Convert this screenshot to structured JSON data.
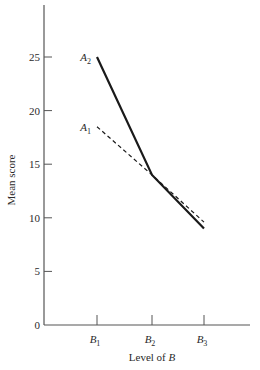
{
  "chart_data": {
    "type": "line",
    "title": "",
    "xlabel": "Level of B",
    "xlabel_prefix": "Level of ",
    "xlabel_var": "B",
    "ylabel": "Mean score",
    "categories": [
      "B1",
      "B2",
      "B3"
    ],
    "category_labels": [
      {
        "base": "B",
        "sub": "1"
      },
      {
        "base": "B",
        "sub": "2"
      },
      {
        "base": "B",
        "sub": "3"
      }
    ],
    "series": [
      {
        "name": "A2",
        "label_base": "A",
        "label_sub": "2",
        "style": "solid",
        "values": [
          25,
          14,
          9
        ]
      },
      {
        "name": "A1",
        "label_base": "A",
        "label_sub": "1",
        "style": "dashed",
        "values": [
          18.5,
          14,
          9.6
        ]
      }
    ],
    "ylim": [
      0,
      29
    ],
    "yticks": [
      0,
      5,
      10,
      15,
      20,
      25
    ],
    "grid": false,
    "legend": "inline labels at B1"
  }
}
